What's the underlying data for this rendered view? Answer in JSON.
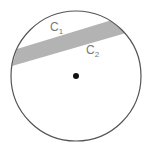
{
  "diagram": {
    "circle": {
      "cx": 76,
      "cy": 76,
      "r": 65,
      "stroke": "#555555"
    },
    "center_point": {
      "cx": 76,
      "cy": 76,
      "r": 3,
      "fill": "#111111"
    },
    "band": {
      "fill": "#b3b3b3",
      "points": "17,49 112,20 126,33 12,66"
    },
    "labels": [
      {
        "id": "c1",
        "text": "C",
        "sub": "1",
        "x": 50,
        "y": 31
      },
      {
        "id": "c2",
        "text": "C",
        "sub": "2",
        "x": 86,
        "y": 54
      }
    ]
  }
}
